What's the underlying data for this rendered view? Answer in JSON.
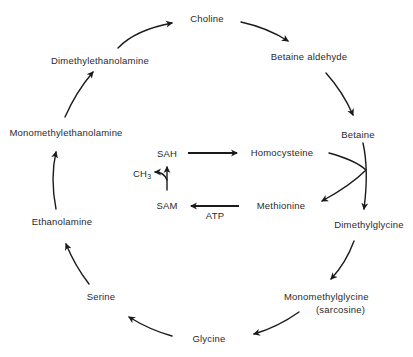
{
  "diagram": {
    "title": "",
    "outer_cycle": {
      "nodes": [
        {
          "id": "choline",
          "label": "Choline"
        },
        {
          "id": "betaine_aldehyde",
          "label": "Betaine aldehyde"
        },
        {
          "id": "betaine",
          "label": "Betaine"
        },
        {
          "id": "dimethylglycine",
          "label": "Dimethylglycine"
        },
        {
          "id": "monomethylglycine",
          "label": "Monomethylglycine",
          "sublabel": "(sarcosine)"
        },
        {
          "id": "glycine",
          "label": "Glycine"
        },
        {
          "id": "serine",
          "label": "Serine"
        },
        {
          "id": "ethanolamine",
          "label": "Ethanolamine"
        },
        {
          "id": "monomethylethanolamine",
          "label": "Monomethylethanolamine"
        },
        {
          "id": "dimethylethanolamine",
          "label": "Dimethylethanolamine"
        }
      ],
      "direction": "clockwise"
    },
    "inner_cycle": {
      "nodes": [
        {
          "id": "sah",
          "label": "SAH"
        },
        {
          "id": "homocysteine",
          "label": "Homocysteine"
        },
        {
          "id": "methionine",
          "label": "Methionine"
        },
        {
          "id": "sam",
          "label": "SAM"
        }
      ],
      "cofactors": {
        "atp": "ATP",
        "methyl": "CH",
        "methyl_sub": "3"
      }
    },
    "edges": [
      {
        "from": "dimethylethanolamine",
        "to": "choline"
      },
      {
        "from": "choline",
        "to": "betaine_aldehyde"
      },
      {
        "from": "betaine_aldehyde",
        "to": "betaine"
      },
      {
        "from": "betaine",
        "to": "dimethylglycine",
        "coupled": "homocysteine -> methionine"
      },
      {
        "from": "dimethylglycine",
        "to": "monomethylglycine"
      },
      {
        "from": "monomethylglycine",
        "to": "glycine"
      },
      {
        "from": "glycine",
        "to": "serine"
      },
      {
        "from": "serine",
        "to": "ethanolamine"
      },
      {
        "from": "ethanolamine",
        "to": "monomethylethanolamine"
      },
      {
        "from": "monomethylethanolamine",
        "to": "dimethylethanolamine"
      },
      {
        "from": "sah",
        "to": "homocysteine"
      },
      {
        "from": "methionine",
        "to": "sam",
        "cofactor": "ATP"
      },
      {
        "from": "sam",
        "to": "sah",
        "releases": "CH3"
      }
    ]
  }
}
